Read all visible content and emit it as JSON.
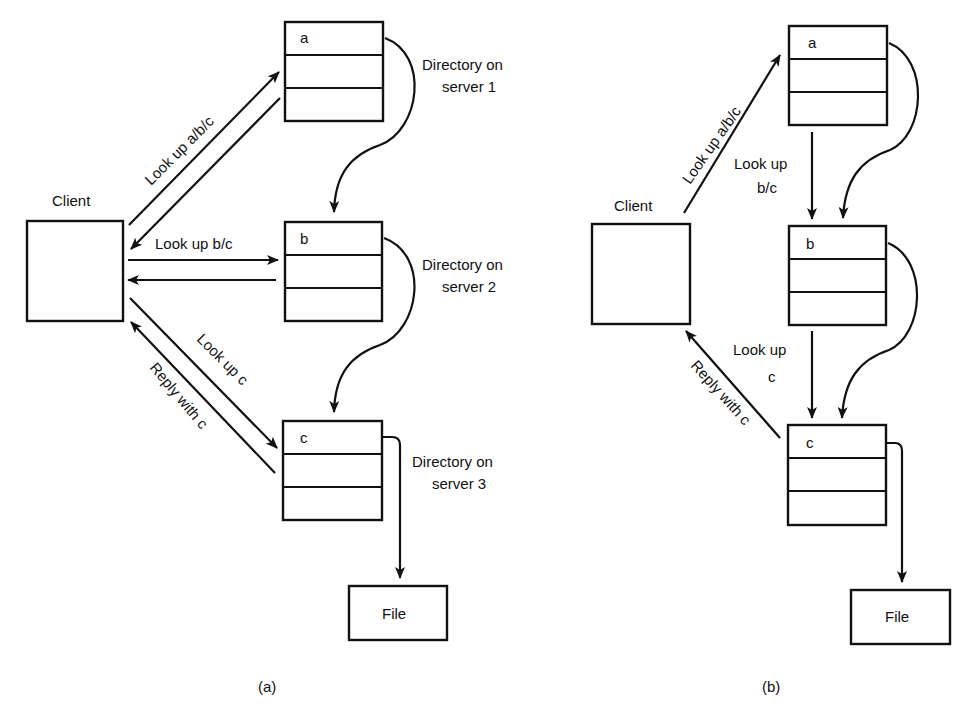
{
  "panel_a": {
    "caption": "(a)",
    "client_label": "Client",
    "directories": [
      {
        "entry": "a",
        "label_line1": "Directory on",
        "label_line2": "server 1"
      },
      {
        "entry": "b",
        "label_line1": "Directory on",
        "label_line2": "server 2"
      },
      {
        "entry": "c",
        "label_line1": "Directory on",
        "label_line2": "server 3"
      }
    ],
    "file_label": "File",
    "messages": {
      "lookup_abc": "Look up a/b/c",
      "lookup_bc": "Look up b/c",
      "lookup_c": "Look up c",
      "reply_c": "Reply with c"
    }
  },
  "panel_b": {
    "caption": "(b)",
    "client_label": "Client",
    "directories": [
      {
        "entry": "a"
      },
      {
        "entry": "b"
      },
      {
        "entry": "c"
      }
    ],
    "file_label": "File",
    "messages": {
      "lookup_abc": "Look up a/b/c",
      "lookup_bc_line1": "Look up",
      "lookup_bc_line2": "b/c",
      "lookup_c_line1": "Look up",
      "lookup_c_line2": "c",
      "reply_c": "Reply with c"
    }
  }
}
